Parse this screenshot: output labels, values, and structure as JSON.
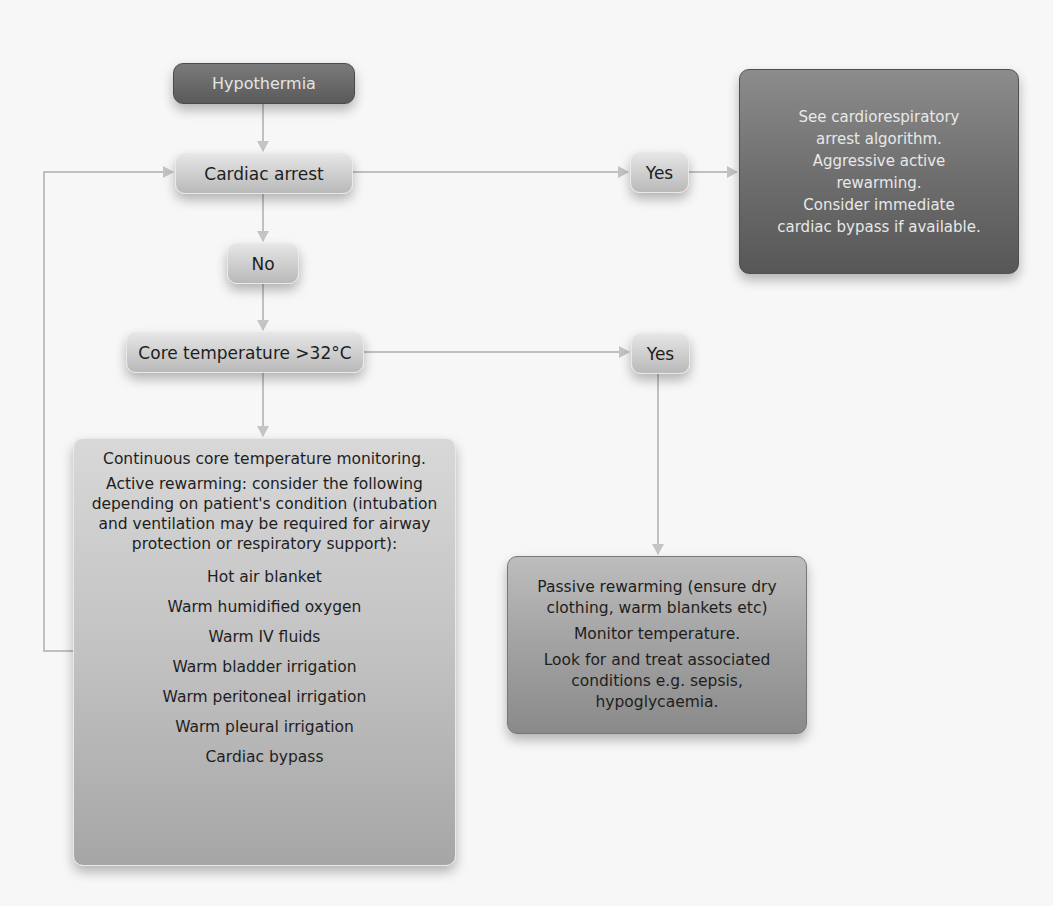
{
  "diagram": {
    "title_node": "Hypothermia",
    "cardiac_arrest": "Cardiac arrest",
    "no_label": "No",
    "core_temp": "Core temperature >32°C",
    "yes_arrest": "Yes",
    "yes_temp": "Yes",
    "arrest_box": {
      "lines": [
        "See cardiorespiratory",
        "arrest algorithm.",
        "Aggressive active",
        "rewarming.",
        "Consider immediate",
        "cardiac bypass if available."
      ]
    },
    "active_box": {
      "para1": "Continuous core temperature monitoring.",
      "para2": "Active rewarming: consider the following depending on patient's condition (intubation and ventilation may be required for airway protection or respiratory support):",
      "items": [
        "Hot air blanket",
        "Warm humidified oxygen",
        "Warm IV fluids",
        "Warm bladder irrigation",
        "Warm peritoneal irrigation",
        "Warm pleural irrigation",
        "Cardiac bypass"
      ]
    },
    "passive_box": {
      "para1": "Passive rewarming (ensure dry clothing, warm blankets etc)",
      "para2": "Monitor temperature.",
      "para3": "Look for and treat associated conditions e.g. sepsis, hypoglycaemia."
    },
    "colors": {
      "background": "#f7f7f7",
      "connector": "#bdbdbd",
      "dark_node": "#5a5a5a",
      "light_node": "#cdcdcd"
    }
  }
}
